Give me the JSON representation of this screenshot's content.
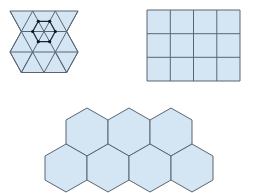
{
  "diagram": {
    "title": "",
    "colors": {
      "fill": "#d4e5f4",
      "stroke": "#5b6572",
      "highlight": "#1e2632"
    },
    "tilings": [
      {
        "name": "triangular-tiling",
        "shape": "equilateral triangle",
        "count": 16,
        "note": "hexagon of 6 triangles highlighted with vertex dots"
      },
      {
        "name": "square-tiling",
        "shape": "square",
        "rows": 3,
        "columns": 4,
        "count": 12
      },
      {
        "name": "hexagonal-tiling",
        "shape": "regular hexagon",
        "rows": [
          3,
          4
        ],
        "count": 7
      }
    ]
  }
}
